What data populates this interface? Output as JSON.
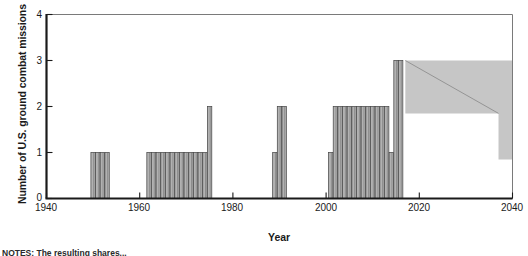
{
  "chart_data": {
    "type": "bar",
    "title": "",
    "subtitle": "",
    "xlabel": "Year",
    "ylabel": "Number of U.S. ground combat missions",
    "xlim": [
      1940,
      2040
    ],
    "ylim": [
      0,
      4
    ],
    "xticks": [
      1940,
      1960,
      1980,
      2000,
      2020,
      2040
    ],
    "yticks": [
      0,
      1,
      2,
      3,
      4
    ],
    "grid": false,
    "legend": null,
    "bar_color": "#b2b2b2",
    "bar_edge_color": "#4a4a4a",
    "band_color": "#c6c6c6",
    "axis_color": "#1a1a1a",
    "x": [
      1950,
      1951,
      1952,
      1953,
      1962,
      1963,
      1964,
      1965,
      1966,
      1967,
      1968,
      1969,
      1970,
      1971,
      1972,
      1973,
      1974,
      1975,
      1989,
      1990,
      1991,
      2001,
      2002,
      2003,
      2004,
      2005,
      2006,
      2007,
      2008,
      2009,
      2010,
      2011,
      2012,
      2013,
      2014,
      2015,
      2016
    ],
    "values": [
      1,
      1,
      1,
      1,
      1,
      1,
      1,
      1,
      1,
      1,
      1,
      1,
      1,
      1,
      1,
      1,
      1,
      2,
      1,
      2,
      2,
      1,
      2,
      2,
      2,
      2,
      2,
      2,
      2,
      2,
      2,
      2,
      2,
      2,
      1,
      3,
      3
    ],
    "projection_band": {
      "label": "",
      "start_year": 2017,
      "end_year": 2040,
      "upper_start": 3.0,
      "upper_end": 3.0,
      "lower_start": 1.85,
      "lower_end": 0.85,
      "step_year": 2037,
      "trend_start": 3.0,
      "trend_end": 1.85
    }
  },
  "axis": {
    "y_title": "Number of U.S. ground combat missions",
    "x_title": "Year",
    "y_tick_labels": [
      "0",
      "1",
      "2",
      "3",
      "4"
    ],
    "x_tick_labels": [
      "1940",
      "1960",
      "1980",
      "2000",
      "2020",
      "2040"
    ]
  },
  "footer": {
    "note": "NOTES: The resulting shares..."
  }
}
